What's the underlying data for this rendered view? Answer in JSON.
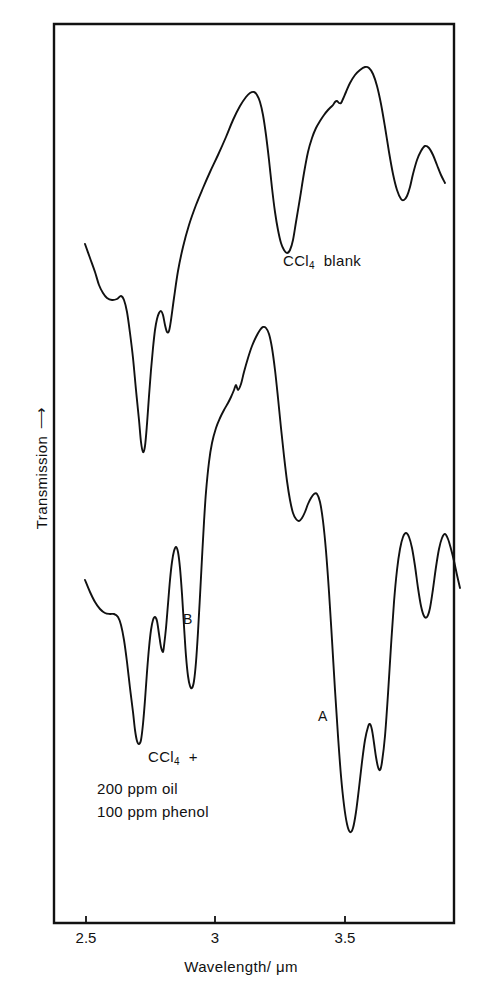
{
  "figure": {
    "background_color": "#ffffff",
    "ink_color": "#111111"
  },
  "axes": {
    "x_title": "Wavelength/ μm",
    "y_title": "Transmission",
    "y_arrow": "⟶",
    "x_ticks": [
      "2.5",
      "3",
      "3.5"
    ]
  },
  "annotations": {
    "upper_trace": "CCl4 blank",
    "upper_trace_html": "CCl<sub>4</sub>&nbsp; blank",
    "lower_trace": "CCl4 +",
    "lower_trace_html": "CCl<sub>4</sub>&nbsp; +",
    "sample_line_1": "200 ppm  oil",
    "sample_line_2": "100 ppm  phenol",
    "peak_a": "A",
    "peak_b": "B"
  },
  "chart_data": {
    "type": "line",
    "title": "",
    "xlabel": "Wavelength/ μm",
    "ylabel": "Transmission",
    "xlim": [
      2.42,
      3.72
    ],
    "ylim": [
      0,
      1
    ],
    "grid": false,
    "legend": "none",
    "x_ticks": [
      2.5,
      3.0,
      3.5
    ],
    "x_tick_labels": [
      "2.5",
      "3",
      "3.5"
    ],
    "y_ticks": [],
    "y_tick_labels": [],
    "axis_note": "Transmission axis is unscaled (arrow indicates increasing transmission); two traces are vertically offset.",
    "series": [
      {
        "name": "CCl4 blank",
        "label": "CCl4 blank",
        "points_px": [
          [
            85,
            244
          ],
          [
            90,
            258
          ],
          [
            95,
            272
          ],
          [
            99,
            285
          ],
          [
            103,
            293
          ],
          [
            107,
            298
          ],
          [
            112,
            300
          ],
          [
            117,
            299
          ],
          [
            121,
            296
          ],
          [
            124,
            300
          ],
          [
            127,
            312
          ],
          [
            130,
            333
          ],
          [
            133,
            358
          ],
          [
            136,
            390
          ],
          [
            139,
            420
          ],
          [
            141,
            442
          ],
          [
            143,
            452
          ],
          [
            145,
            446
          ],
          [
            147,
            424
          ],
          [
            149,
            396
          ],
          [
            151,
            370
          ],
          [
            153,
            348
          ],
          [
            155,
            330
          ],
          [
            157,
            319
          ],
          [
            159,
            313
          ],
          [
            161,
            311
          ],
          [
            163,
            315
          ],
          [
            165,
            325
          ],
          [
            167,
            332
          ],
          [
            169,
            331
          ],
          [
            171,
            320
          ],
          [
            174,
            298
          ],
          [
            178,
            271
          ],
          [
            183,
            247
          ],
          [
            189,
            225
          ],
          [
            196,
            205
          ],
          [
            203,
            188
          ],
          [
            210,
            172
          ],
          [
            218,
            155
          ],
          [
            226,
            137
          ],
          [
            233,
            120
          ],
          [
            240,
            106
          ],
          [
            246,
            97
          ],
          [
            250,
            93
          ],
          [
            254,
            92
          ],
          [
            257,
            95
          ],
          [
            260,
            102
          ],
          [
            263,
            115
          ],
          [
            266,
            135
          ],
          [
            269,
            160
          ],
          [
            272,
            188
          ],
          [
            275,
            212
          ],
          [
            278,
            230
          ],
          [
            281,
            243
          ],
          [
            284,
            250
          ],
          [
            287,
            253
          ],
          [
            290,
            250
          ],
          [
            293,
            240
          ],
          [
            296,
            222
          ],
          [
            300,
            198
          ],
          [
            304,
            173
          ],
          [
            308,
            152
          ],
          [
            312,
            138
          ],
          [
            316,
            128
          ],
          [
            320,
            121
          ],
          [
            324,
            115
          ],
          [
            328,
            110
          ],
          [
            331,
            107
          ],
          [
            333,
            105
          ],
          [
            335,
            102
          ],
          [
            337,
            101
          ],
          [
            339,
            103
          ],
          [
            341,
            103
          ],
          [
            343,
            99
          ],
          [
            346,
            92
          ],
          [
            350,
            83
          ],
          [
            355,
            75
          ],
          [
            360,
            70
          ],
          [
            365,
            67
          ],
          [
            369,
            68
          ],
          [
            373,
            74
          ],
          [
            377,
            86
          ],
          [
            381,
            104
          ],
          [
            385,
            127
          ],
          [
            389,
            152
          ],
          [
            393,
            174
          ],
          [
            397,
            190
          ],
          [
            401,
            199
          ],
          [
            404,
            200
          ],
          [
            407,
            196
          ],
          [
            410,
            187
          ],
          [
            413,
            174
          ],
          [
            417,
            160
          ],
          [
            421,
            151
          ],
          [
            425,
            146
          ],
          [
            429,
            148
          ],
          [
            433,
            155
          ],
          [
            437,
            165
          ],
          [
            441,
            175
          ],
          [
            445,
            183
          ]
        ]
      },
      {
        "name": "CCl4 + 200 ppm oil, 100 ppm phenol",
        "label": "CCl4 +",
        "points_px": [
          [
            85,
            580
          ],
          [
            90,
            592
          ],
          [
            95,
            602
          ],
          [
            100,
            609
          ],
          [
            105,
            613
          ],
          [
            110,
            614
          ],
          [
            114,
            614
          ],
          [
            118,
            617
          ],
          [
            121,
            625
          ],
          [
            124,
            640
          ],
          [
            127,
            662
          ],
          [
            130,
            688
          ],
          [
            133,
            712
          ],
          [
            135,
            730
          ],
          [
            137,
            741
          ],
          [
            139,
            744
          ],
          [
            141,
            740
          ],
          [
            143,
            724
          ],
          [
            145,
            700
          ],
          [
            147,
            672
          ],
          [
            149,
            648
          ],
          [
            151,
            630
          ],
          [
            153,
            620
          ],
          [
            155,
            617
          ],
          [
            157,
            621
          ],
          [
            159,
            634
          ],
          [
            161,
            647
          ],
          [
            163,
            652
          ],
          [
            164,
            646
          ],
          [
            166,
            628
          ],
          [
            168,
            604
          ],
          [
            170,
            580
          ],
          [
            172,
            562
          ],
          [
            174,
            551
          ],
          [
            176,
            547
          ],
          [
            178,
            552
          ],
          [
            180,
            568
          ],
          [
            182,
            594
          ],
          [
            184,
            626
          ],
          [
            186,
            656
          ],
          [
            188,
            676
          ],
          [
            190,
            686
          ],
          [
            192,
            688
          ],
          [
            194,
            681
          ],
          [
            196,
            662
          ],
          [
            198,
            632
          ],
          [
            200,
            596
          ],
          [
            202,
            558
          ],
          [
            204,
            522
          ],
          [
            206,
            492
          ],
          [
            209,
            462
          ],
          [
            212,
            443
          ],
          [
            216,
            428
          ],
          [
            220,
            418
          ],
          [
            224,
            410
          ],
          [
            228,
            403
          ],
          [
            231,
            397
          ],
          [
            234,
            390
          ],
          [
            236,
            385
          ],
          [
            238,
            390
          ],
          [
            241,
            384
          ],
          [
            244,
            372
          ],
          [
            248,
            358
          ],
          [
            252,
            346
          ],
          [
            256,
            337
          ],
          [
            260,
            330
          ],
          [
            263,
            327
          ],
          [
            266,
            328
          ],
          [
            269,
            334
          ],
          [
            272,
            348
          ],
          [
            275,
            370
          ],
          [
            278,
            398
          ],
          [
            281,
            428
          ],
          [
            284,
            456
          ],
          [
            287,
            481
          ],
          [
            290,
            500
          ],
          [
            293,
            513
          ],
          [
            296,
            519
          ],
          [
            299,
            521
          ],
          [
            302,
            518
          ],
          [
            305,
            512
          ],
          [
            308,
            504
          ],
          [
            311,
            498
          ],
          [
            314,
            494
          ],
          [
            317,
            494
          ],
          [
            320,
            502
          ],
          [
            323,
            521
          ],
          [
            326,
            551
          ],
          [
            329,
            592
          ],
          [
            332,
            640
          ],
          [
            335,
            690
          ],
          [
            338,
            736
          ],
          [
            341,
            776
          ],
          [
            344,
            805
          ],
          [
            347,
            824
          ],
          [
            350,
            832
          ],
          [
            353,
            828
          ],
          [
            356,
            812
          ],
          [
            359,
            788
          ],
          [
            362,
            762
          ],
          [
            365,
            740
          ],
          [
            368,
            727
          ],
          [
            370,
            724
          ],
          [
            372,
            730
          ],
          [
            374,
            743
          ],
          [
            376,
            757
          ],
          [
            378,
            767
          ],
          [
            380,
            770
          ],
          [
            382,
            762
          ],
          [
            385,
            736
          ],
          [
            388,
            694
          ],
          [
            391,
            646
          ],
          [
            394,
            602
          ],
          [
            397,
            570
          ],
          [
            400,
            549
          ],
          [
            403,
            537
          ],
          [
            406,
            533
          ],
          [
            409,
            537
          ],
          [
            412,
            548
          ],
          [
            415,
            566
          ],
          [
            418,
            588
          ],
          [
            421,
            606
          ],
          [
            424,
            616
          ],
          [
            427,
            617
          ],
          [
            430,
            608
          ],
          [
            433,
            589
          ],
          [
            436,
            567
          ],
          [
            439,
            549
          ],
          [
            442,
            538
          ],
          [
            445,
            534
          ],
          [
            448,
            539
          ],
          [
            451,
            549
          ],
          [
            454,
            561
          ],
          [
            457,
            575
          ],
          [
            460,
            588
          ]
        ]
      }
    ]
  },
  "geometry": {
    "frame_px": {
      "left": 54,
      "top": 24,
      "right": 454,
      "bottom": 923
    },
    "x_tick_px": [
      86,
      215,
      345
    ],
    "tick_length_px": 7
  }
}
